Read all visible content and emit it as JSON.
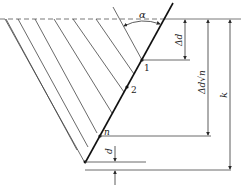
{
  "diagram": {
    "colors": {
      "line": "#2a2a2a",
      "background": "#ffffff"
    },
    "labels": {
      "angle": "α",
      "delta_d": "Δd",
      "delta_d_sqrt_n": "Δd√n",
      "k": "k",
      "d": "d",
      "point_1": "1",
      "point_2": "2",
      "point_n": "n"
    }
  }
}
